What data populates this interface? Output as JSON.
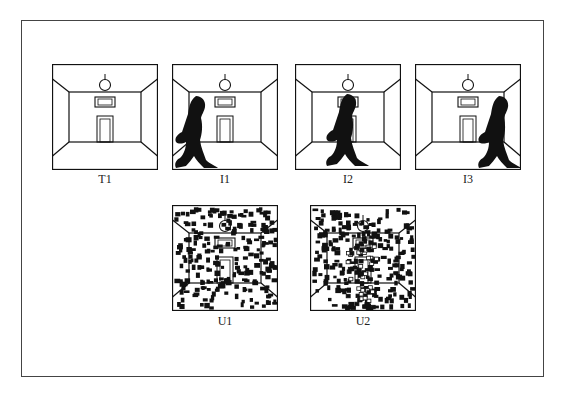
{
  "figure": {
    "panels": [
      {
        "id": "T1",
        "label": "T1",
        "type": "room",
        "figure": null
      },
      {
        "id": "I1",
        "label": "I1",
        "type": "room",
        "figure": "left"
      },
      {
        "id": "I2",
        "label": "I2",
        "type": "room",
        "figure": "center"
      },
      {
        "id": "I3",
        "label": "I3",
        "type": "room",
        "figure": "right"
      },
      {
        "id": "U1",
        "label": "U1",
        "type": "noisy-room"
      },
      {
        "id": "U2",
        "label": "U2",
        "type": "noisy-room-figure"
      }
    ],
    "colors": {
      "ink": "#111111",
      "background": "#ffffff",
      "frame": "#444444"
    }
  }
}
